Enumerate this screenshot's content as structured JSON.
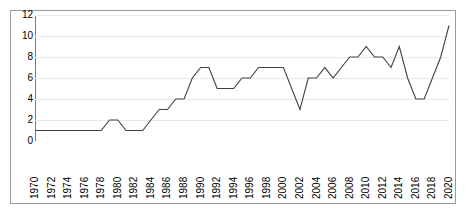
{
  "chart_data": {
    "type": "line",
    "title": "",
    "subtitle": "",
    "xlabel": "",
    "ylabel": "",
    "x": [
      1970,
      1971,
      1972,
      1973,
      1974,
      1975,
      1976,
      1977,
      1978,
      1979,
      1980,
      1981,
      1982,
      1983,
      1984,
      1985,
      1986,
      1987,
      1988,
      1989,
      1990,
      1991,
      1992,
      1993,
      1994,
      1995,
      1996,
      1997,
      1998,
      1999,
      2000,
      2001,
      2002,
      2003,
      2004,
      2005,
      2006,
      2007,
      2008,
      2009,
      2010,
      2011,
      2012,
      2013,
      2014,
      2015,
      2016,
      2017,
      2018,
      2019,
      2020
    ],
    "values": [
      1,
      1,
      1,
      1,
      1,
      1,
      1,
      1,
      1,
      2,
      2,
      1,
      1,
      1,
      2,
      3,
      3,
      4,
      4,
      6,
      7,
      7,
      5,
      5,
      5,
      6,
      6,
      7,
      7,
      7,
      7,
      5,
      3,
      6,
      6,
      7,
      6,
      7,
      8,
      8,
      9,
      8,
      8,
      7,
      9,
      6,
      4,
      4,
      6,
      8,
      11
    ],
    "series": [
      {
        "name": "series-1",
        "values": [
          1,
          1,
          1,
          1,
          1,
          1,
          1,
          1,
          1,
          2,
          2,
          1,
          1,
          1,
          2,
          3,
          3,
          4,
          4,
          6,
          7,
          7,
          5,
          5,
          5,
          6,
          6,
          7,
          7,
          7,
          7,
          5,
          3,
          6,
          6,
          7,
          6,
          7,
          8,
          8,
          9,
          8,
          8,
          7,
          9,
          6,
          4,
          4,
          6,
          8,
          11
        ],
        "color": "#404040"
      }
    ],
    "y_ticks": [
      0,
      2,
      4,
      6,
      8,
      10,
      12
    ],
    "y_tick_labels": [
      "0",
      "2",
      "4",
      "6",
      "8",
      "10",
      "12"
    ],
    "x_ticks": [
      1970,
      1972,
      1974,
      1976,
      1978,
      1980,
      1982,
      1984,
      1986,
      1988,
      1990,
      1992,
      1994,
      1996,
      1998,
      2000,
      2002,
      2004,
      2006,
      2008,
      2010,
      2012,
      2014,
      2016,
      2018,
      2020
    ],
    "x_tick_labels": [
      "1970",
      "1972",
      "1974",
      "1976",
      "1978",
      "1980",
      "1982",
      "1984",
      "1986",
      "1988",
      "1990",
      "1992",
      "1994",
      "1996",
      "1998",
      "2000",
      "2002",
      "2004",
      "2006",
      "2008",
      "2010",
      "2012",
      "2014",
      "2016",
      "2018",
      "2020"
    ],
    "xlim": [
      1970,
      2020
    ],
    "ylim": [
      0,
      12
    ],
    "grid": true,
    "grid_axis": "y",
    "legend": false,
    "legend_position": "none",
    "x_tick_rotation": 90,
    "line_color": "#404040",
    "gridline_color": "#e9e9e9",
    "axis_color": "#7a7a7a",
    "border_color": "#9a9a9a",
    "background_color": "#ffffff",
    "markers": false
  }
}
